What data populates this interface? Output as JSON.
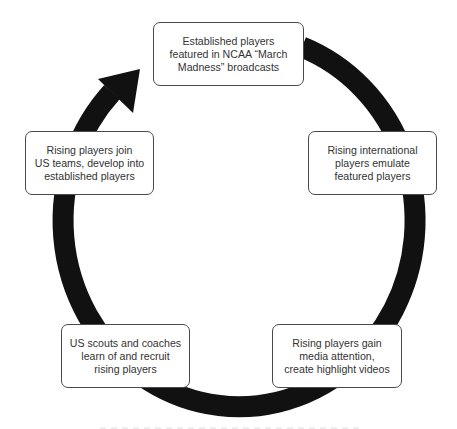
{
  "diagram": {
    "type": "cycle",
    "direction": "clockwise",
    "ring_color": "#111111",
    "box_border_color": "#4a4a4a",
    "text_color": "#333333",
    "nodes": [
      {
        "id": "featured",
        "label": "Established players\nfeatured in NCAA “March\nMadness” broadcasts"
      },
      {
        "id": "emulate",
        "label": "Rising international\nplayers emulate\nfeatured players"
      },
      {
        "id": "media",
        "label": "Rising players gain\nmedia attention,\ncreate highlight videos"
      },
      {
        "id": "recruit",
        "label": "US scouts and coaches\nlearn of and recruit\nrising players"
      },
      {
        "id": "develop",
        "label": "Rising players join\nUS teams, develop into\nestablished players"
      }
    ],
    "edges": [
      {
        "from": "featured",
        "to": "emulate"
      },
      {
        "from": "emulate",
        "to": "media"
      },
      {
        "from": "media",
        "to": "recruit"
      },
      {
        "from": "recruit",
        "to": "develop"
      },
      {
        "from": "develop",
        "to": "featured",
        "arrowhead": true
      }
    ]
  }
}
